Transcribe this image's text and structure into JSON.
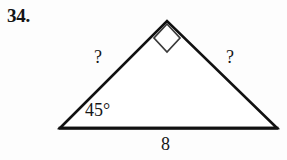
{
  "figure": {
    "problem_number": "34.",
    "shape": "right triangle",
    "stroke_color": "#111111",
    "background_color": "#fdfdfd",
    "labels": {
      "left_side": "?",
      "right_side": "?",
      "base": "8",
      "angle": "45°",
      "right_angle_marker": "right-angle"
    },
    "geometry": {
      "left_vertex": "60,128",
      "apex_vertex": "167,21",
      "right_vertex": "277,128"
    }
  }
}
